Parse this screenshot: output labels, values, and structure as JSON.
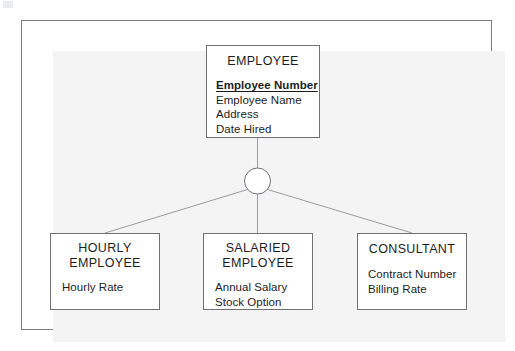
{
  "diagram": {
    "type": "generalization-specialization-erd",
    "colors": {
      "surface": "#f4f4f4",
      "frame_border": "#7d7f82",
      "box_border": "#6f7175",
      "box_fill": "#ffffff",
      "line": "#9a9ca0",
      "text": "#1d1d1d"
    },
    "supertype": {
      "name": "EMPLOYEE",
      "attributes": [
        {
          "label": "Employee Number",
          "primary_key": true
        },
        {
          "label": "Employee Name",
          "primary_key": false
        },
        {
          "label": "Address",
          "primary_key": false
        },
        {
          "label": "Date Hired",
          "primary_key": false
        }
      ]
    },
    "connector": {
      "shape": "circle",
      "center_x": 257.5,
      "center_y": 181,
      "radius": 13
    },
    "subtypes": [
      {
        "name": "HOURLY\nEMPLOYEE",
        "attributes": [
          {
            "label": "Hourly Rate",
            "primary_key": false
          }
        ]
      },
      {
        "name": "SALARIED\nEMPLOYEE",
        "attributes": [
          {
            "label": "Annual Salary",
            "primary_key": false
          },
          {
            "label": "Stock Option",
            "primary_key": false
          }
        ]
      },
      {
        "name": "CONSULTANT",
        "attributes": [
          {
            "label": "Contract Number",
            "primary_key": false
          },
          {
            "label": "Billing Rate",
            "primary_key": false
          }
        ]
      }
    ]
  }
}
